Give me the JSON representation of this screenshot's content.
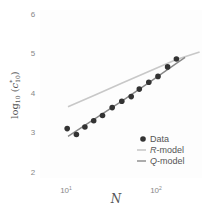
{
  "chart_data": {
    "type": "line",
    "title": "",
    "xlabel": "N",
    "ylabel": "log(c*10)",
    "xscale": "log",
    "xlim": [
      6,
      60
    ],
    "ylim": [
      1.85,
      6.1
    ],
    "xticks": [
      {
        "value": 10,
        "label": "10",
        "exp": "1"
      },
      {
        "value": 100,
        "label": "10",
        "exp": "2"
      }
    ],
    "yticks": [
      2,
      3,
      4,
      5,
      6
    ],
    "grid": false,
    "legend_position": "lower right",
    "series": [
      {
        "name": "Data",
        "kind": "scatter",
        "color": "#333333",
        "points": [
          {
            "x": 9.8,
            "y": 3.1
          },
          {
            "x": 12.4,
            "y": 2.95
          },
          {
            "x": 15.4,
            "y": 3.14
          },
          {
            "x": 19.3,
            "y": 3.3
          },
          {
            "x": 24.2,
            "y": 3.43
          },
          {
            "x": 31.0,
            "y": 3.63
          },
          {
            "x": 39.6,
            "y": 3.79
          },
          {
            "x": 50.4,
            "y": 3.91
          },
          {
            "x": 62.0,
            "y": 4.1
          },
          {
            "x": 79.0,
            "y": 4.27
          },
          {
            "x": 100.0,
            "y": 4.42
          },
          {
            "x": 128.0,
            "y": 4.66
          },
          {
            "x": 160.0,
            "y": 4.86
          }
        ]
      },
      {
        "name": "R-model",
        "kind": "line",
        "color": "#c8c8c8",
        "points": [
          {
            "x": 10,
            "y": 3.65
          },
          {
            "x": 20,
            "y": 3.95
          },
          {
            "x": 40,
            "y": 4.25
          },
          {
            "x": 80,
            "y": 4.55
          },
          {
            "x": 160,
            "y": 4.85
          },
          {
            "x": 290,
            "y": 5.04
          }
        ]
      },
      {
        "name": "Q-model",
        "kind": "line",
        "color": "#888888",
        "points": [
          {
            "x": 10,
            "y": 2.9
          },
          {
            "x": 20,
            "y": 3.35
          },
          {
            "x": 40,
            "y": 3.8
          },
          {
            "x": 80,
            "y": 4.27
          },
          {
            "x": 160,
            "y": 4.75
          },
          {
            "x": 200,
            "y": 4.9
          }
        ]
      }
    ]
  },
  "axes": {
    "y_label_main": "log",
    "y_label_sub": "10",
    "y_label_c": "c",
    "y_label_star": "*",
    "x_label": "N",
    "y_ticks": [
      "6",
      "5",
      "4",
      "3",
      "2"
    ],
    "x_tick_base": "10",
    "x_tick_exps": [
      "1",
      "2"
    ]
  },
  "legend": {
    "items": [
      {
        "label": "Data"
      },
      {
        "label_italic": "R",
        "label_rest": "-model"
      },
      {
        "label_italic": "Q",
        "label_rest": "-model"
      }
    ]
  }
}
